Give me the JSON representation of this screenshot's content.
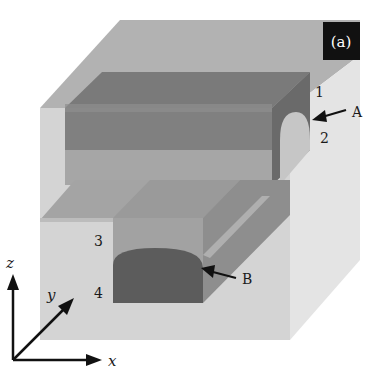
{
  "figure": {
    "panel_label": "(a)",
    "region_labels": {
      "r1": "1",
      "r2": "2",
      "r3": "3",
      "r4": "4"
    },
    "pointer_labels": {
      "A": "A",
      "B": "B"
    },
    "axes": {
      "x": "x",
      "y": "y",
      "z": "z"
    },
    "colors": {
      "background": "#ffffff",
      "outer_block_top": "#b4b4b4",
      "outer_block_front": "#d6d6d6",
      "outer_block_side": "#e6e6e6",
      "upper_waveguide_top": "#7c7c7c",
      "upper_waveguide_front": "#8a8a8a",
      "upper_core_end": "#c8c8c8",
      "lower_channel": "#a0a0a0",
      "lower_core": "#5e5e5e",
      "panel_label_bg": "#111111",
      "ink": "#1a1a1a"
    }
  }
}
